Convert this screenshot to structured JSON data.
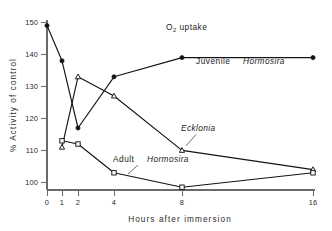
{
  "figure": {
    "cropped_top_text": "",
    "background_color": "#ffffff",
    "ink_color": "#141414"
  },
  "axes": {
    "y_title": "% Activity of control",
    "x_title": "Hours  after  immersion",
    "y_ticks": [
      "100",
      "110",
      "120",
      "130",
      "140",
      "150"
    ],
    "x_ticks": [
      "0",
      "1",
      "2",
      "4",
      "8",
      "16"
    ]
  },
  "annotations": {
    "o2_uptake": "O",
    "o2_uptake_sub": "2",
    "o2_uptake_rest": " uptake",
    "juvenile_prefix": "Juvenile",
    "juvenile_species": "Hormosira",
    "ecklonia_species": "Ecklonia",
    "adult_prefix": "Adult",
    "adult_species": "Hormosira"
  },
  "chart_data": {
    "type": "line",
    "title": "O2 uptake",
    "xlabel": "Hours after immersion",
    "ylabel": "% Activity of control",
    "x": [
      0,
      1,
      2,
      4,
      8,
      16
    ],
    "x_positions_are_ordinal": true,
    "xlim": [
      0,
      16
    ],
    "ylim": [
      96,
      152
    ],
    "grid": false,
    "legend": "inline-annotations",
    "series": [
      {
        "name": "Juvenile Hormosira",
        "marker": "filled-circle",
        "x": [
          0,
          1,
          2,
          4,
          8,
          16
        ],
        "values": [
          150,
          139,
          118,
          134,
          140,
          140
        ]
      },
      {
        "name": "Ecklonia",
        "marker": "open-triangle",
        "x": [
          1,
          2,
          4,
          8,
          16
        ],
        "values": [
          112,
          134,
          128,
          111,
          105
        ]
      },
      {
        "name": "Adult Hormosira",
        "marker": "open-square",
        "x": [
          1,
          2,
          4,
          8,
          16
        ],
        "values": [
          114,
          113,
          104,
          99.5,
          104
        ]
      }
    ]
  }
}
